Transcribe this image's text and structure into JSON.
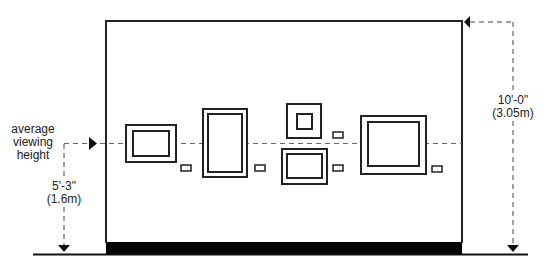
{
  "diagram": {
    "labels": {
      "viewing_line1": "average",
      "viewing_line2": "viewing",
      "viewing_line3": "height",
      "eye_height_imperial": "5'-3\"",
      "eye_height_metric": "(1.6m)",
      "wall_height_imperial": "10'-0\"",
      "wall_height_metric": "(3.05m)"
    },
    "colors": {
      "line": "#222222",
      "dashed": "#555555",
      "baseboard": "#000000"
    }
  }
}
